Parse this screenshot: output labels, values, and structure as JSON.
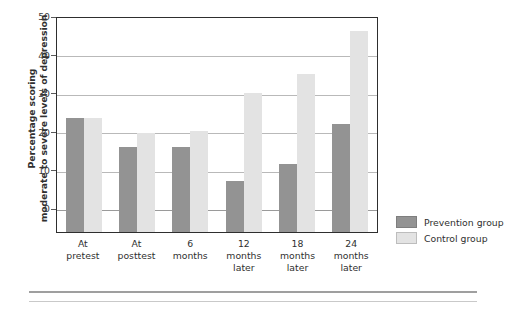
{
  "chart_data": {
    "type": "bar",
    "title": "",
    "xlabel": "",
    "ylabel": "Percentage scoring moderate to severe levels of depression",
    "ylabel_lines": [
      "Percentage scoring",
      "moderate to severe levels of depression"
    ],
    "ylim": [
      0,
      50
    ],
    "yticks": [
      0,
      10,
      20,
      30,
      40,
      50
    ],
    "ytick_labels": [
      "0",
      "10",
      "20",
      "30",
      "40",
      "50"
    ],
    "grid": true,
    "legend_position": "right",
    "categories": [
      "At pretest",
      "At posttest",
      "6 months later",
      "12 months later",
      "18 months later",
      "24 months later"
    ],
    "category_lines": [
      [
        "At",
        "pretest"
      ],
      [
        "At",
        "posttest"
      ],
      [
        "6",
        "months"
      ],
      [
        "12",
        "months",
        "later"
      ],
      [
        "18",
        "months",
        "later"
      ],
      [
        "24",
        "months",
        "later"
      ]
    ],
    "series": [
      {
        "name": "Prevention group",
        "color": "#939393",
        "values": [
          23.5,
          16,
          16,
          7,
          11.5,
          22
        ]
      },
      {
        "name": "Control group",
        "color": "#e3e3e3",
        "values": [
          23.5,
          19.5,
          20,
          30,
          35,
          46
        ]
      }
    ]
  },
  "legend": {
    "items": [
      {
        "label": "Prevention group",
        "color": "#939393"
      },
      {
        "label": "Control group",
        "color": "#e3e3e3"
      }
    ]
  }
}
